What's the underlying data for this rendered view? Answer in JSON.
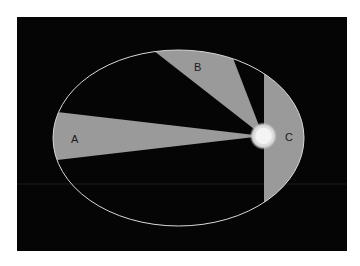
{
  "diagram": {
    "background": "#050505",
    "sector_color": "#9a9a9a",
    "orbit_color": "#d8d8d8",
    "labels": {
      "a": "A",
      "b": "B",
      "c": "C"
    },
    "sectors": [
      {
        "id": "A",
        "label": "A"
      },
      {
        "id": "B",
        "label": "B"
      },
      {
        "id": "C",
        "label": "C"
      }
    ],
    "sun": {
      "name": "Sun",
      "color": "#f2f2f2"
    }
  }
}
